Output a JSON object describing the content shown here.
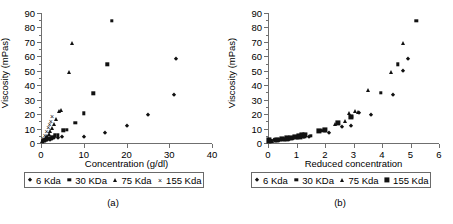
{
  "figure": {
    "panels": [
      {
        "id": "a",
        "caption": "(a)",
        "ylabel": "Viscosity (mPas)",
        "xlabel": "Concentration (g/dl)",
        "legend": [
          {
            "label": "6 Kda",
            "marker": "diamond"
          },
          {
            "label": "30 KDa",
            "marker": "square"
          },
          {
            "label": "75 Kda",
            "marker": "triangle"
          },
          {
            "label": "155 Kda",
            "marker": "cross"
          }
        ]
      },
      {
        "id": "b",
        "caption": "(b)",
        "ylabel": "Viscosity (mPas)",
        "xlabel": "Reduced concentration",
        "legend": [
          {
            "label": "6 Kda",
            "marker": "diamond"
          },
          {
            "label": "30 KDa",
            "marker": "square"
          },
          {
            "label": "75 Kda",
            "marker": "triangle"
          },
          {
            "label": "155 Kda",
            "marker": "bigsquare"
          }
        ]
      }
    ]
  },
  "chart_data": [
    {
      "type": "scatter",
      "panel": "(a)",
      "title": "",
      "xlabel": "Concentration (g/dl)",
      "ylabel": "Viscosity (mPas)",
      "xlim": [
        0,
        40
      ],
      "ylim": [
        0,
        90
      ],
      "xticks": [
        0,
        10,
        20,
        30,
        40
      ],
      "yticks": [
        0,
        10,
        20,
        30,
        40,
        50,
        60,
        70,
        80,
        90
      ],
      "grid": false,
      "legend_position": "below-axes",
      "series": [
        {
          "name": "6 Kda",
          "marker": "diamond",
          "points": [
            [
              0.5,
              1.2
            ],
            [
              1.0,
              1.6
            ],
            [
              1.5,
              2.0
            ],
            [
              2.0,
              2.4
            ],
            [
              2.5,
              2.8
            ],
            [
              3.0,
              3.2
            ],
            [
              4.0,
              3.8
            ],
            [
              5.0,
              4.4
            ],
            [
              10.0,
              4.5
            ],
            [
              15.0,
              7.0
            ],
            [
              20.0,
              11.5
            ],
            [
              25.0,
              19.3
            ],
            [
              31.0,
              33.5
            ],
            [
              31.5,
              58.2
            ]
          ]
        },
        {
          "name": "30 KDa",
          "marker": "square",
          "points": [
            [
              0.4,
              1.3
            ],
            [
              0.8,
              1.8
            ],
            [
              1.2,
              2.3
            ],
            [
              1.6,
              2.9
            ],
            [
              2.0,
              3.5
            ],
            [
              2.6,
              4.3
            ],
            [
              3.2,
              5.2
            ],
            [
              4.0,
              5.3
            ],
            [
              5.2,
              8.8
            ],
            [
              6.0,
              9.0
            ],
            [
              8.0,
              14.0
            ],
            [
              10.0,
              20.5
            ],
            [
              12.2,
              34.5
            ],
            [
              15.5,
              54.5
            ],
            [
              16.5,
              84.8
            ]
          ]
        },
        {
          "name": "75 Kda",
          "marker": "triangle",
          "points": [
            [
              0.3,
              1.5
            ],
            [
              0.6,
              2.2
            ],
            [
              0.9,
              3.0
            ],
            [
              1.2,
              4.0
            ],
            [
              1.5,
              5.0
            ],
            [
              1.8,
              6.2
            ],
            [
              2.2,
              8.0
            ],
            [
              2.6,
              10.5
            ],
            [
              3.0,
              13.0
            ],
            [
              3.6,
              16.5
            ],
            [
              4.2,
              22.5
            ],
            [
              4.6,
              22.8
            ],
            [
              6.5,
              49.0
            ],
            [
              7.3,
              69.5
            ]
          ]
        },
        {
          "name": "155 Kda",
          "marker": "cross",
          "points": [
            [
              0.5,
              3.5
            ],
            [
              0.9,
              5.5
            ],
            [
              1.3,
              8.0
            ],
            [
              1.7,
              11.0
            ],
            [
              2.0,
              13.0
            ],
            [
              2.3,
              15.5
            ],
            [
              2.6,
              18.5
            ]
          ]
        }
      ]
    },
    {
      "type": "scatter",
      "panel": "(b)",
      "title": "",
      "xlabel": "Reduced concentration",
      "ylabel": "Viscosity (mPas)",
      "xlim": [
        0,
        6
      ],
      "ylim": [
        0,
        90
      ],
      "xticks": [
        0,
        1,
        2,
        3,
        4,
        5,
        6
      ],
      "yticks": [
        0,
        10,
        20,
        30,
        40,
        50,
        60,
        70,
        80,
        90
      ],
      "grid": false,
      "legend_position": "below-axes",
      "series": [
        {
          "name": "6 Kda",
          "marker": "diamond",
          "points": [
            [
              0.05,
              1.2
            ],
            [
              0.12,
              1.5
            ],
            [
              0.2,
              1.8
            ],
            [
              0.3,
              2.1
            ],
            [
              0.4,
              2.4
            ],
            [
              1.25,
              4.0
            ],
            [
              1.45,
              4.3
            ],
            [
              2.15,
              7.0
            ],
            [
              2.6,
              11.0
            ],
            [
              2.9,
              11.6
            ],
            [
              3.2,
              20.8
            ],
            [
              3.6,
              19.3
            ],
            [
              4.4,
              33.5
            ],
            [
              4.9,
              58.2
            ],
            [
              4.75,
              50.0
            ]
          ]
        },
        {
          "name": "30 KDa",
          "marker": "square",
          "points": [
            [
              0.1,
              1.4
            ],
            [
              0.25,
              1.8
            ],
            [
              0.45,
              2.2
            ],
            [
              0.6,
              2.6
            ],
            [
              0.75,
              3.0
            ],
            [
              0.9,
              3.4
            ],
            [
              1.05,
              4.0
            ],
            [
              1.3,
              4.6
            ],
            [
              1.5,
              4.8
            ],
            [
              1.85,
              8.6
            ],
            [
              2.0,
              8.8
            ],
            [
              2.45,
              14.0
            ],
            [
              2.95,
              18.3
            ],
            [
              3.95,
              34.6
            ],
            [
              4.55,
              54.5
            ],
            [
              5.2,
              84.8
            ]
          ]
        },
        {
          "name": "75 Kda",
          "marker": "triangle",
          "points": [
            [
              0.15,
              1.6
            ],
            [
              0.35,
              2.1
            ],
            [
              0.55,
              2.6
            ],
            [
              0.7,
              3.1
            ],
            [
              0.85,
              3.7
            ],
            [
              1.0,
              4.2
            ],
            [
              1.15,
              4.9
            ],
            [
              1.9,
              8.8
            ],
            [
              2.35,
              13.5
            ],
            [
              2.7,
              15.5
            ],
            [
              2.85,
              21.0
            ],
            [
              3.05,
              22.2
            ],
            [
              3.15,
              21.4
            ],
            [
              3.5,
              36.5
            ],
            [
              4.3,
              49.0
            ],
            [
              4.75,
              69.5
            ]
          ]
        },
        {
          "name": "155 Kda",
          "marker": "bigsquare",
          "points": [
            [
              0.02,
              1.8
            ],
            [
              0.3,
              2.2
            ],
            [
              0.5,
              2.7
            ],
            [
              0.65,
              3.2
            ],
            [
              0.8,
              3.6
            ],
            [
              0.95,
              4.2
            ],
            [
              1.1,
              4.6
            ],
            [
              1.2,
              5.2
            ],
            [
              1.3,
              5.5
            ],
            [
              1.8,
              8.6
            ],
            [
              2.0,
              9.0
            ],
            [
              2.45,
              13.8
            ],
            [
              2.9,
              18.0
            ]
          ]
        }
      ]
    }
  ]
}
